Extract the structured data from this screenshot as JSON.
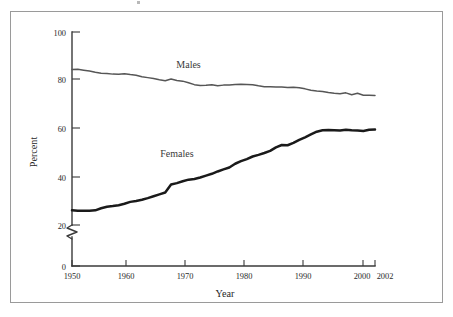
{
  "figure": {
    "frame_border_color": "#9a9a9a",
    "background_color": "#ffffff"
  },
  "axis": {
    "y_title": "Percent",
    "x_title": "Year",
    "y_tick_labels": [
      "0",
      "20",
      "40",
      "60",
      "80",
      "100"
    ],
    "x_tick_labels": [
      "1950",
      "1960",
      "1970",
      "1980",
      "1990",
      "2000",
      "2002"
    ],
    "has_axis_break": true,
    "axis_color": "#3a3a3a"
  },
  "annotations": {
    "males_label": "Males",
    "females_label": "Females"
  },
  "chart_data": {
    "type": "line",
    "title": "",
    "subtitle": "",
    "xlabel": "Year",
    "ylabel": "Percent",
    "xlim": [
      1950,
      2002
    ],
    "ylim": [
      0,
      100
    ],
    "grid": false,
    "legend_position": "inline-annotation",
    "y_ticks": [
      0,
      20,
      40,
      60,
      80,
      100
    ],
    "x_ticks": [
      1950,
      1960,
      1970,
      1980,
      1990,
      2000,
      2002
    ],
    "y_axis_break_between": [
      0,
      20
    ],
    "series": [
      {
        "name": "Males",
        "color": "#565656",
        "line_width": 1.5,
        "label_x": 1970,
        "label_y": 84.5,
        "x": [
          1950,
          1951,
          1952,
          1953,
          1954,
          1955,
          1956,
          1957,
          1958,
          1959,
          1960,
          1961,
          1962,
          1963,
          1964,
          1965,
          1966,
          1967,
          1968,
          1969,
          1970,
          1971,
          1972,
          1973,
          1974,
          1975,
          1976,
          1977,
          1978,
          1979,
          1980,
          1981,
          1982,
          1983,
          1984,
          1985,
          1986,
          1987,
          1988,
          1989,
          1990,
          1991,
          1992,
          1993,
          1994,
          1995,
          1996,
          1997,
          1998,
          1999,
          2000,
          2001,
          2002
        ],
        "values": [
          84.0,
          84.1,
          83.7,
          83.3,
          82.8,
          82.4,
          82.3,
          82.0,
          81.9,
          82.2,
          81.8,
          81.5,
          80.9,
          80.5,
          80.1,
          79.6,
          79.2,
          79.9,
          79.3,
          79.0,
          78.3,
          77.5,
          77.1,
          77.2,
          77.5,
          77.0,
          77.3,
          77.4,
          77.6,
          77.7,
          77.6,
          77.5,
          77.0,
          76.6,
          76.6,
          76.5,
          76.5,
          76.3,
          76.4,
          76.2,
          75.7,
          75.1,
          74.8,
          74.6,
          74.1,
          73.8,
          73.6,
          74.0,
          73.2,
          73.8,
          73.0,
          73.0,
          72.9
        ]
      },
      {
        "name": "Females",
        "color": "#1a1a1a",
        "line_width": 2.5,
        "label_x": 1968,
        "label_y": 46.5,
        "x": [
          1950,
          1951,
          1952,
          1953,
          1954,
          1955,
          1956,
          1957,
          1958,
          1959,
          1960,
          1961,
          1962,
          1963,
          1964,
          1965,
          1966,
          1967,
          1968,
          1969,
          1970,
          1971,
          1972,
          1973,
          1974,
          1975,
          1976,
          1977,
          1978,
          1979,
          1980,
          1981,
          1982,
          1983,
          1984,
          1985,
          1986,
          1987,
          1988,
          1989,
          1990,
          1991,
          1992,
          1993,
          1994,
          1995,
          1996,
          1997,
          1998,
          1999,
          2000,
          2001,
          2002
        ],
        "values": [
          23.8,
          23.6,
          23.6,
          23.6,
          23.8,
          24.7,
          25.3,
          25.6,
          26.0,
          26.6,
          27.4,
          27.8,
          28.3,
          29.0,
          29.8,
          30.6,
          31.4,
          34.8,
          35.4,
          36.2,
          36.9,
          37.2,
          37.8,
          38.6,
          39.4,
          40.4,
          41.3,
          42.1,
          43.7,
          44.8,
          45.7,
          46.8,
          47.5,
          48.3,
          49.2,
          50.7,
          51.7,
          51.6,
          52.6,
          53.9,
          55.0,
          56.2,
          57.4,
          58.0,
          58.1,
          58.0,
          57.9,
          58.2,
          58.0,
          57.9,
          57.7,
          58.2,
          58.3
        ]
      }
    ]
  }
}
